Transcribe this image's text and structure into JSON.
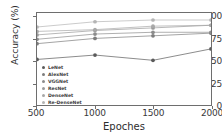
{
  "chart_data": {
    "type": "line",
    "title": "",
    "xlabel": "Epoches",
    "ylabel": "Accuracy (%)",
    "x": [
      500,
      1000,
      1500,
      2000
    ],
    "xticklabels": [
      "500",
      "1000",
      "1500",
      "2000"
    ],
    "yticklabels": [
      "0",
      "25",
      "50",
      "75",
      "100"
    ],
    "yticks": [
      0,
      25,
      50,
      75,
      100
    ],
    "xlim": [
      500,
      2000
    ],
    "ylim": [
      0,
      105
    ],
    "grid": false,
    "legend_position": "lower left",
    "marker": "circle",
    "series": [
      {
        "name": "LeNet",
        "values": [
          52,
          57,
          51,
          64
        ],
        "color": "#5a5a5a"
      },
      {
        "name": "AlexNet",
        "values": [
          70,
          76,
          79,
          82
        ],
        "color": "#7d7d7d"
      },
      {
        "name": "VGGNet",
        "values": [
          75,
          81,
          83,
          83
        ],
        "color": "#8c8c8c"
      },
      {
        "name": "ResNet",
        "values": [
          80,
          85,
          88,
          91
        ],
        "color": "#9a9a9a"
      },
      {
        "name": "DenseNet",
        "values": [
          84,
          86,
          90,
          91
        ],
        "color": "#a8a8a8"
      },
      {
        "name": "Re-DenseNet",
        "values": [
          89,
          95,
          97,
          97
        ],
        "color": "#b4b4b4"
      }
    ]
  },
  "axes": {
    "yticks": [
      {
        "label": "100",
        "value": 100
      },
      {
        "label": "75",
        "value": 75
      },
      {
        "label": "50",
        "value": 50
      },
      {
        "label": "25",
        "value": 25
      },
      {
        "label": "0",
        "value": 0
      }
    ],
    "xticks": [
      {
        "label": "500",
        "value": 500
      },
      {
        "label": "1000",
        "value": 1000
      },
      {
        "label": "1500",
        "value": 1500
      },
      {
        "label": "2000",
        "value": 2000
      }
    ],
    "xlabel": "Epoches",
    "ylabel": "Accuracy (%)"
  },
  "legend": {
    "items": [
      {
        "label": "LeNet"
      },
      {
        "label": "AlexNet"
      },
      {
        "label": "VGGNet"
      },
      {
        "label": "ResNet"
      },
      {
        "label": "DenseNet"
      },
      {
        "label": "Re-DenseNet"
      }
    ]
  }
}
